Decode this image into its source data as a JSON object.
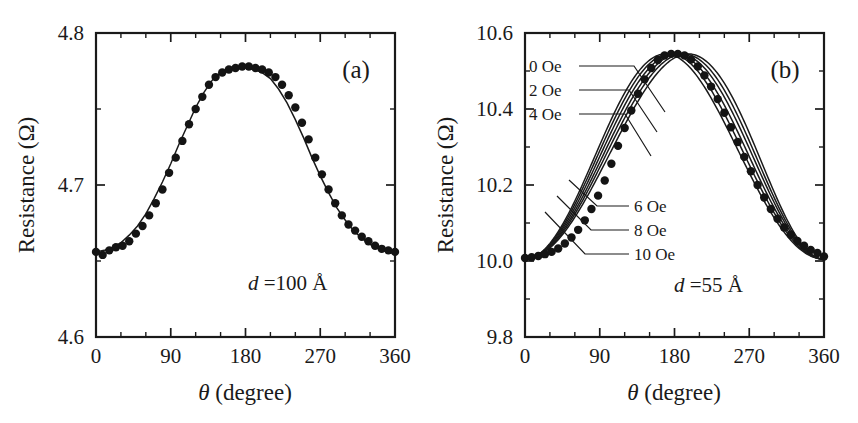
{
  "figure": {
    "panels": [
      {
        "tag": "(a)",
        "annotation_d": "d",
        "annotation_eq": " =100 Å",
        "xlabel_theta": "θ",
        "xlabel_rest": " (degree)",
        "ylabel": "Resistance (Ω)"
      },
      {
        "tag": "(b)",
        "annotation_d": "d",
        "annotation_eq": " =55 Å",
        "xlabel_theta": "θ",
        "xlabel_rest": " (degree)",
        "ylabel": "Resistance (Ω)"
      }
    ],
    "legend_labels": [
      "0 Oe",
      "2 Oe",
      "4 Oe",
      "6 Oe",
      "8 Oe",
      "10 Oe"
    ],
    "line_color": "#1a1a1a",
    "marker_color": "#141414",
    "background": "#ffffff"
  },
  "chart_data": [
    {
      "type": "scatter",
      "panel": "(a)",
      "title": "",
      "xlabel": "θ (degree)",
      "ylabel": "Resistance (Ω)",
      "xlim": [
        0,
        360
      ],
      "ylim": [
        4.6,
        4.8
      ],
      "xticks": [
        0,
        90,
        180,
        270,
        360
      ],
      "xticklabels": [
        "0",
        "90",
        "180",
        "270",
        "360"
      ],
      "xminorticks": [
        30,
        60,
        120,
        150,
        210,
        240,
        300,
        330
      ],
      "yticks": [
        4.6,
        4.7,
        4.8
      ],
      "yticklabels": [
        "4.6",
        "4.7",
        "4.8"
      ],
      "yminorticks": [
        4.65,
        4.75
      ],
      "grid": false,
      "legend": "none",
      "annotations": [
        {
          "text": "d =100 Å",
          "x": 255,
          "y": 4.648
        }
      ],
      "series": [
        {
          "name": "fit curve",
          "style": "line",
          "x": [
            0,
            10,
            20,
            30,
            40,
            50,
            60,
            70,
            80,
            90,
            100,
            110,
            120,
            130,
            140,
            150,
            160,
            170,
            180,
            190,
            200,
            210,
            220,
            230,
            240,
            250,
            260,
            270,
            280,
            290,
            300,
            310,
            320,
            330,
            340,
            350,
            360
          ],
          "y": [
            4.656,
            4.657,
            4.659,
            4.662,
            4.667,
            4.673,
            4.681,
            4.691,
            4.702,
            4.714,
            4.727,
            4.739,
            4.751,
            4.761,
            4.769,
            4.774,
            4.777,
            4.778,
            4.777,
            4.776,
            4.774,
            4.77,
            4.763,
            4.754,
            4.743,
            4.731,
            4.718,
            4.706,
            4.695,
            4.685,
            4.677,
            4.67,
            4.665,
            4.661,
            4.658,
            4.656,
            4.655
          ]
        },
        {
          "name": "measured data",
          "style": "markers",
          "x": [
            0,
            8,
            16,
            24,
            32,
            40,
            48,
            56,
            64,
            72,
            80,
            88,
            96,
            104,
            112,
            120,
            128,
            136,
            144,
            152,
            160,
            168,
            176,
            184,
            192,
            200,
            208,
            216,
            224,
            232,
            240,
            248,
            256,
            264,
            272,
            280,
            288,
            296,
            304,
            312,
            320,
            328,
            336,
            344,
            352,
            360
          ],
          "y": [
            4.656,
            4.654,
            4.657,
            4.659,
            4.66,
            4.663,
            4.668,
            4.673,
            4.68,
            4.688,
            4.697,
            4.708,
            4.718,
            4.729,
            4.74,
            4.75,
            4.758,
            4.766,
            4.771,
            4.774,
            4.776,
            4.777,
            4.778,
            4.778,
            4.777,
            4.776,
            4.774,
            4.771,
            4.766,
            4.759,
            4.751,
            4.741,
            4.73,
            4.718,
            4.707,
            4.697,
            4.688,
            4.68,
            4.674,
            4.67,
            4.666,
            4.663,
            4.66,
            4.658,
            4.657,
            4.656
          ]
        }
      ]
    },
    {
      "type": "line",
      "panel": "(b)",
      "title": "",
      "xlabel": "θ (degree)",
      "ylabel": "Resistance (Ω)",
      "xlim": [
        0,
        360
      ],
      "ylim": [
        9.8,
        10.6
      ],
      "xticks": [
        0,
        90,
        180,
        270,
        360
      ],
      "xticklabels": [
        "0",
        "90",
        "180",
        "270",
        "360"
      ],
      "xminorticks": [
        30,
        60,
        120,
        150,
        210,
        240,
        300,
        330
      ],
      "yticks": [
        9.8,
        10.0,
        10.2,
        10.4,
        10.6
      ],
      "yticklabels": [
        "9.8",
        "10.0",
        "10.2",
        "10.4",
        "10.6"
      ],
      "yminorticks": [
        9.9,
        10.1,
        10.3,
        10.5
      ],
      "grid": false,
      "legend": "inline-leader-lines",
      "annotations": [
        {
          "text": "d =55 Å",
          "x": 250,
          "y": 9.945
        }
      ],
      "series": [
        {
          "name": "0 Oe",
          "style": "line",
          "shift_deg": -16.0,
          "baseline": 10.005,
          "peak": 10.545
        },
        {
          "name": "2 Oe",
          "style": "line",
          "shift_deg": -10.5,
          "baseline": 10.005,
          "peak": 10.545
        },
        {
          "name": "4 Oe",
          "style": "line",
          "shift_deg": -5.5,
          "baseline": 10.005,
          "peak": 10.545
        },
        {
          "name": "6 Oe",
          "style": "line",
          "shift_deg": 0.0,
          "baseline": 10.005,
          "peak": 10.545
        },
        {
          "name": "8 Oe",
          "style": "line",
          "shift_deg": 5.5,
          "baseline": 10.005,
          "peak": 10.545
        },
        {
          "name": "10 Oe",
          "style": "line",
          "shift_deg": 11.0,
          "baseline": 10.005,
          "peak": 10.545
        },
        {
          "name": "measured data",
          "style": "markers",
          "x": [
            0,
            8,
            16,
            24,
            32,
            40,
            48,
            56,
            64,
            72,
            80,
            88,
            96,
            104,
            112,
            120,
            128,
            136,
            144,
            152,
            160,
            168,
            176,
            184,
            192,
            200,
            208,
            216,
            224,
            232,
            240,
            248,
            256,
            264,
            272,
            280,
            288,
            296,
            304,
            312,
            320,
            328,
            336,
            344,
            352,
            360
          ],
          "y": [
            10.008,
            10.01,
            10.013,
            10.018,
            10.024,
            10.033,
            10.046,
            10.062,
            10.082,
            10.107,
            10.137,
            10.172,
            10.212,
            10.256,
            10.303,
            10.35,
            10.396,
            10.44,
            10.478,
            10.508,
            10.529,
            10.541,
            10.545,
            10.545,
            10.541,
            10.53,
            10.512,
            10.488,
            10.459,
            10.426,
            10.39,
            10.352,
            10.313,
            10.274,
            10.236,
            10.2,
            10.167,
            10.137,
            10.111,
            10.088,
            10.069,
            10.053,
            10.04,
            10.029,
            10.021,
            10.012
          ]
        }
      ]
    }
  ]
}
